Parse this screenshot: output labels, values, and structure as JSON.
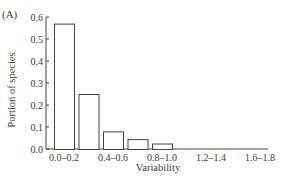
{
  "panel_label": "(A)",
  "chart_data": {
    "type": "bar",
    "title": "",
    "xlabel": "Variability",
    "ylabel": "Portion of species",
    "categories": [
      "0.0–0.2",
      "0.2–0.4",
      "0.4–0.6",
      "0.6–0.8",
      "0.8–1.0",
      "1.0–1.2",
      "1.2–1.4",
      "1.4–1.6",
      "1.6–1.8"
    ],
    "x_tick_labels_shown": [
      "0.0–0.2",
      "0.4–0.6",
      "0.8–1.0",
      "1.2–1.4",
      "1.6–1.8"
    ],
    "values": [
      0.57,
      0.25,
      0.08,
      0.045,
      0.025,
      0,
      0,
      0,
      0
    ],
    "ylim": [
      0,
      0.6
    ],
    "y_ticks": [
      "0.0",
      "0.1",
      "0.2",
      "0.3",
      "0.4",
      "0.5",
      "0.6"
    ],
    "grid": false,
    "legend": null
  }
}
